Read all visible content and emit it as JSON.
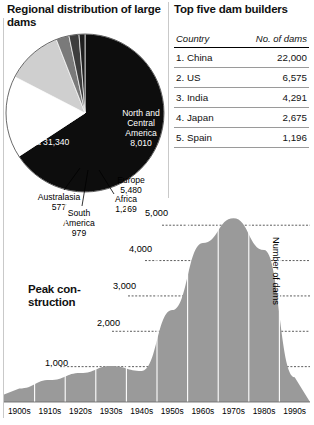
{
  "pie_panel": {
    "title": "Regional distribution of large dams"
  },
  "table_panel": {
    "title": "Top five dam builders",
    "columns": [
      "Country",
      "No. of dams"
    ],
    "rows": [
      {
        "rank_country": "1. China",
        "dams": "22,000"
      },
      {
        "rank_country": "2. US",
        "dams": "6,575"
      },
      {
        "rank_country": "3. India",
        "dams": "4,291"
      },
      {
        "rank_country": "4. Japan",
        "dams": "2,675"
      },
      {
        "rank_country": "5. Spain",
        "dams": "1,196"
      }
    ]
  },
  "area_panel": {
    "title": "Peak con-\nstruction",
    "title_line1": "Peak con-",
    "title_line2": "struction",
    "ylabel": "Number of dams"
  },
  "labels": {
    "asia": "Asia 31,340",
    "north_central_america": "North and Central America 8,010",
    "nca_l1": "North and",
    "nca_l2": "Central",
    "nca_l3": "America",
    "nca_l4": "8,010",
    "europe_l1": "Europe",
    "europe_l2": "5,480",
    "australasia_l1": "Australasia",
    "australasia_l2": "577",
    "south_america_l1": "South",
    "south_america_l2": "America",
    "south_america_l3": "979",
    "africa_l1": "Africa",
    "africa_l2": "1,269"
  },
  "colors": {
    "asia": "#0d0d0d",
    "north_central_america": "#ffffff",
    "europe": "#cfcfcf",
    "africa": "#7a7a7a",
    "south_america": "#3d3d3d",
    "australasia": "#1f1f1f",
    "area_fill": "#9a9a9a",
    "rule": "#c9c9c9",
    "text": "#111111"
  },
  "chart_data": [
    {
      "type": "pie",
      "title": "Regional distribution of large dams",
      "categories": [
        "Asia",
        "North and Central America",
        "Europe",
        "Africa",
        "South America",
        "Australasia"
      ],
      "values": [
        31340,
        8010,
        5480,
        1269,
        979,
        577
      ],
      "unit": "large dams",
      "legend": "inline-labels"
    },
    {
      "type": "table",
      "title": "Top five dam builders",
      "columns": [
        "Country",
        "No. of dams"
      ],
      "categories": [
        "China",
        "US",
        "India",
        "Japan",
        "Spain"
      ],
      "values": [
        22000,
        6575,
        4291,
        2675,
        1196
      ]
    },
    {
      "type": "area",
      "title": "Peak construction",
      "xlabel": "",
      "ylabel": "Number of dams",
      "categories": [
        "1900s",
        "1910s",
        "1920s",
        "1930s",
        "1940s",
        "1950s",
        "1960s",
        "1970s",
        "1980s",
        "1990s"
      ],
      "values": [
        380,
        620,
        820,
        1020,
        880,
        2600,
        4500,
        5200,
        4300,
        700
      ],
      "ylim": [
        0,
        5600
      ],
      "yticks": [
        1000,
        2000,
        3000,
        4000,
        5000
      ],
      "ytick_labels": [
        "1,000",
        "2,000",
        "3,000",
        "4,000",
        "5,000"
      ],
      "grid": true,
      "legend": "none"
    }
  ]
}
